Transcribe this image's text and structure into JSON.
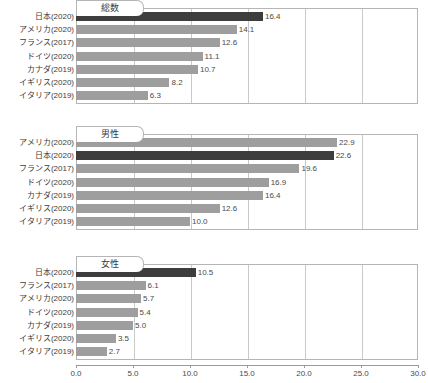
{
  "chart_data": {
    "type": "bar",
    "orientation": "horizontal",
    "title": "",
    "xlabel": "",
    "ylabel": "",
    "xlim": [
      0.0,
      30.0
    ],
    "xticks": [
      "0.0",
      "5.0",
      "10.0",
      "15.0",
      "20.0",
      "25.0",
      "30.0"
    ],
    "xtick_values": [
      0.0,
      5.0,
      10.0,
      15.0,
      20.0,
      25.0,
      30.0
    ],
    "grid": true,
    "legend": "none",
    "highlight_color": "#3d3d3d",
    "bar_color": "#9e9e9e",
    "panels": [
      {
        "label": "総数",
        "categories": [
          "日本(2020)",
          "アメリカ(2020)",
          "フランス(2017)",
          "ドイツ(2020)",
          "カナダ(2019)",
          "イギリス(2020)",
          "イタリア(2019)"
        ],
        "values": [
          16.4,
          14.1,
          12.6,
          11.1,
          10.7,
          8.2,
          6.3
        ],
        "value_labels": [
          "16.4",
          "14.1",
          "12.6",
          "11.1",
          "10.7",
          "8.2",
          "6.3"
        ],
        "highlight_index": 0
      },
      {
        "label": "男性",
        "categories": [
          "アメリカ(2020)",
          "日本(2020)",
          "フランス(2017)",
          "ドイツ(2020)",
          "カナダ(2019)",
          "イギリス(2020)",
          "イタリア(2019)"
        ],
        "values": [
          22.9,
          22.6,
          19.6,
          16.9,
          16.4,
          12.6,
          10.0
        ],
        "value_labels": [
          "22.9",
          "22.6",
          "19.6",
          "16.9",
          "16.4",
          "12.6",
          "10.0"
        ],
        "highlight_index": 1
      },
      {
        "label": "女性",
        "categories": [
          "日本(2020)",
          "フランス(2017)",
          "アメリカ(2020)",
          "ドイツ(2020)",
          "カナダ(2019)",
          "イギリス(2020)",
          "イタリア(2019)"
        ],
        "values": [
          10.5,
          6.1,
          5.7,
          5.4,
          5.0,
          3.5,
          2.7
        ],
        "value_labels": [
          "10.5",
          "6.1",
          "5.7",
          "5.4",
          "5.0",
          "3.5",
          "2.7"
        ],
        "highlight_index": 0
      }
    ]
  }
}
